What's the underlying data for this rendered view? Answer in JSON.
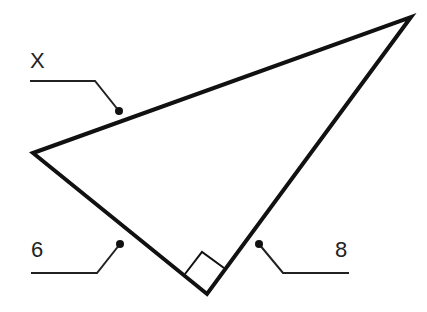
{
  "diagram": {
    "type": "right-triangle",
    "colors": {
      "stroke": "#111111",
      "label": "#222222",
      "background": "#ffffff"
    },
    "labels": {
      "hypotenuse": "X",
      "leg_left": "6",
      "leg_right": "8"
    },
    "right_angle_marker": true
  }
}
